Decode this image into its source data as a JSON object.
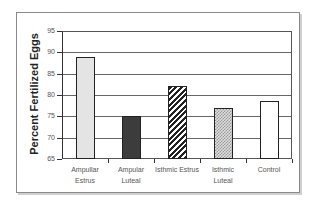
{
  "chart_data": {
    "type": "bar",
    "title": "",
    "xlabel": "",
    "ylabel": "Percent Fertilized Eggs",
    "categories": [
      "Ampullar Estrus",
      "Ampular Luteal",
      "Isthmic Estrus",
      "Isthmic Luteal",
      "Control"
    ],
    "category_lines": [
      [
        "Ampullar",
        "Estrus"
      ],
      [
        "Ampular",
        "Luteal"
      ],
      [
        "Isthmic Estrus",
        ""
      ],
      [
        "Isthmic",
        "Luteal"
      ],
      [
        "Control",
        ""
      ]
    ],
    "values": [
      89,
      75,
      82,
      77,
      78.5
    ],
    "patterns": [
      "light-dotted",
      "dark-dotted",
      "diagonal-stripes",
      "zigzag",
      "solid-white"
    ],
    "ylim": [
      65,
      95
    ],
    "yticks": [
      65,
      70,
      75,
      80,
      85,
      90,
      95
    ],
    "grid": true,
    "legend": null
  }
}
